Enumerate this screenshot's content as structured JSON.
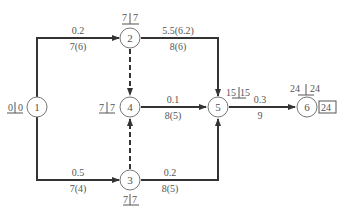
{
  "diagram": {
    "type": "activity-on-arrow network",
    "nodes": [
      {
        "id": "1",
        "label": "1",
        "times": {
          "left": "0",
          "right": "0"
        }
      },
      {
        "id": "2",
        "label": "2",
        "times": {
          "left": "7",
          "right": "7"
        }
      },
      {
        "id": "3",
        "label": "3",
        "times": {
          "left": "7",
          "right": "7"
        }
      },
      {
        "id": "4",
        "label": "4",
        "times": {
          "left": "7",
          "right": "7"
        }
      },
      {
        "id": "5",
        "label": "5",
        "times": {
          "left": "15",
          "right": "15"
        }
      },
      {
        "id": "6",
        "label": "6",
        "times": {
          "left": "24",
          "right": "24"
        },
        "total": "24"
      }
    ],
    "edges": [
      {
        "from": "1",
        "to": "2",
        "top": "0.2",
        "bottom": "7(6)",
        "style": "solid"
      },
      {
        "from": "1",
        "to": "3",
        "top": "0.5",
        "bottom": "7(4)",
        "style": "solid"
      },
      {
        "from": "2",
        "to": "5",
        "top": "5.5(6.2)",
        "bottom": "8(6)",
        "style": "solid"
      },
      {
        "from": "2",
        "to": "4",
        "style": "dashed"
      },
      {
        "from": "3",
        "to": "4",
        "style": "dashed"
      },
      {
        "from": "4",
        "to": "5",
        "top": "0.1",
        "bottom": "8(5)",
        "style": "solid"
      },
      {
        "from": "3",
        "to": "5",
        "top": "0.2",
        "bottom": "8(5)",
        "style": "solid"
      },
      {
        "from": "5",
        "to": "6",
        "top": "0.3",
        "bottom": "9",
        "style": "solid"
      }
    ]
  }
}
